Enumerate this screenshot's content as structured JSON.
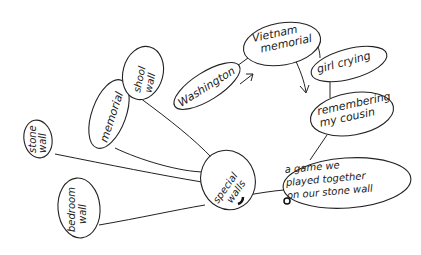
{
  "diagram": {
    "type": "hand-drawn mind map",
    "nodes": [
      {
        "id": "special-walls",
        "lines": [
          "special",
          "walls"
        ]
      },
      {
        "id": "stone-wall",
        "lines": [
          "stone",
          "wall"
        ]
      },
      {
        "id": "bedroom-wall",
        "lines": [
          "bedroom",
          "wall"
        ]
      },
      {
        "id": "memorial",
        "lines": [
          "memorial"
        ]
      },
      {
        "id": "school-wall",
        "lines": [
          "shool",
          "wall"
        ]
      },
      {
        "id": "washington",
        "lines": [
          "Washington"
        ]
      },
      {
        "id": "vietnam-memorial",
        "lines": [
          "Vietnam",
          "memorial"
        ]
      },
      {
        "id": "girl-crying",
        "lines": [
          "girl crying"
        ]
      },
      {
        "id": "remembering-cousin",
        "lines": [
          "remembering",
          "my cousin"
        ]
      },
      {
        "id": "game-stone-wall",
        "lines": [
          "a game we",
          "played together",
          "on our stone wall"
        ]
      }
    ],
    "edges": [
      [
        "special-walls",
        "stone-wall"
      ],
      [
        "special-walls",
        "bedroom-wall"
      ],
      [
        "special-walls",
        "memorial"
      ],
      [
        "special-walls",
        "school-wall"
      ],
      [
        "special-walls",
        "game-stone-wall"
      ],
      [
        "washington",
        "vietnam-memorial"
      ],
      [
        "vietnam-memorial",
        "girl-crying"
      ],
      [
        "girl-crying",
        "remembering-cousin"
      ],
      [
        "remembering-cousin",
        "game-stone-wall"
      ]
    ],
    "arrows": [
      {
        "label": "washington-to-vietnam-arrow"
      },
      {
        "label": "vietnam-to-down-arrow"
      }
    ]
  }
}
